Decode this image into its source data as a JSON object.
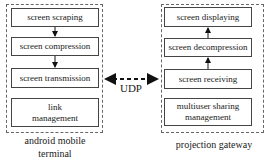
{
  "left_panel": {
    "caption": "android mobile terminal",
    "caption_line1": "android mobile",
    "caption_line2": "terminal",
    "boxes": [
      "screen scraping",
      "screen compression",
      "screen transmission",
      "link management"
    ],
    "link_line1": "link",
    "link_line2": "management"
  },
  "right_panel": {
    "caption": "projection gateway",
    "boxes": [
      "screen displaying",
      "screen decompression",
      "screen receiving",
      "multiuser sharing management"
    ],
    "multi_line1": "multiuser sharing",
    "multi_line2": "management"
  },
  "link": {
    "label": "UDP",
    "style": "dashed bidirectional arrow"
  }
}
